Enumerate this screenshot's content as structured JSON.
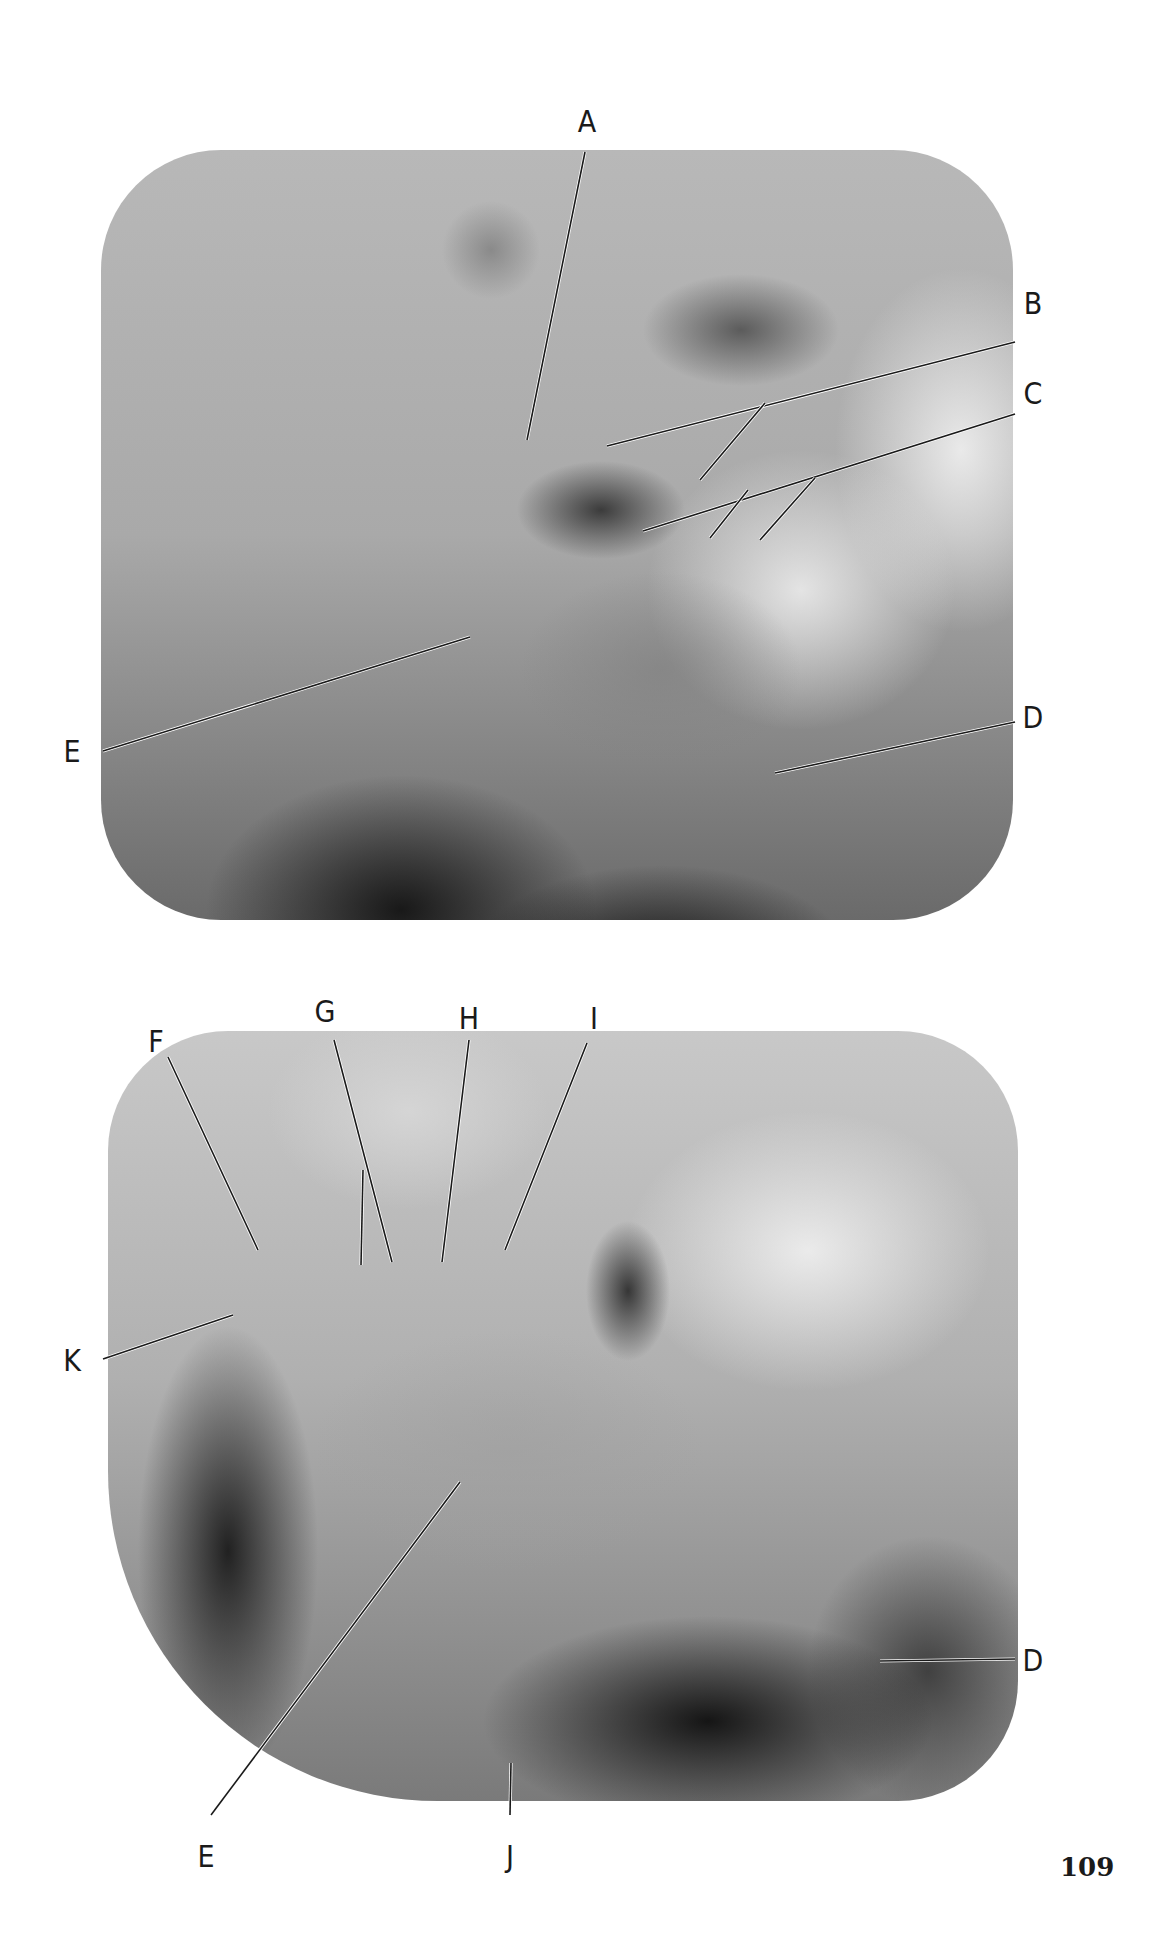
{
  "page": {
    "number": "109",
    "background": "#ffffff"
  },
  "figures": [
    {
      "id": "top",
      "description": "Lateral jaw radiograph (upper figure)",
      "labels": [
        {
          "text": "A",
          "x": 587,
          "y": 122,
          "line": [
            [
              585,
              152
            ],
            [
              527,
              440
            ]
          ]
        },
        {
          "text": "B",
          "x": 1033,
          "y": 304,
          "line": [
            [
              1015,
              342
            ],
            [
              607,
              446
            ]
          ]
        },
        {
          "text": "C",
          "x": 1033,
          "y": 394,
          "line": [
            [
              1015,
              414
            ],
            [
              643,
              531
            ]
          ]
        },
        {
          "text": "D",
          "x": 1033,
          "y": 718,
          "line": [
            [
              1015,
              722
            ],
            [
              775,
              773
            ]
          ]
        },
        {
          "text": "E",
          "x": 72,
          "y": 752,
          "line": [
            [
              103,
              751
            ],
            [
              470,
              637
            ]
          ]
        }
      ],
      "extra_lines": [
        [
          [
            765,
            403
          ],
          [
            700,
            480
          ]
        ],
        [
          [
            748,
            490
          ],
          [
            710,
            538
          ]
        ],
        [
          [
            815,
            478
          ],
          [
            760,
            540
          ]
        ]
      ]
    },
    {
      "id": "bottom",
      "description": "Lateral jaw radiograph (lower figure)",
      "labels": [
        {
          "text": "F",
          "x": 156,
          "y": 1042,
          "line": [
            [
              168,
              1057
            ],
            [
              258,
              1250
            ]
          ]
        },
        {
          "text": "G",
          "x": 325,
          "y": 1012,
          "line": [
            [
              334,
              1040
            ],
            [
              392,
              1262
            ]
          ]
        },
        {
          "text": "H",
          "x": 469,
          "y": 1019,
          "line": [
            [
              469,
              1040
            ],
            [
              442,
              1262
            ]
          ]
        },
        {
          "text": "I",
          "x": 594,
          "y": 1019,
          "line": [
            [
              587,
              1043
            ],
            [
              505,
              1250
            ]
          ]
        },
        {
          "text": "K",
          "x": 72,
          "y": 1361,
          "line": [
            [
              103,
              1359
            ],
            [
              233,
              1315
            ]
          ]
        },
        {
          "text": "D",
          "x": 1033,
          "y": 1661,
          "line": [
            [
              1015,
              1659
            ],
            [
              880,
              1661
            ]
          ]
        },
        {
          "text": "E",
          "x": 206,
          "y": 1857,
          "line": [
            [
              211,
              1815
            ],
            [
              460,
              1482
            ]
          ]
        },
        {
          "text": "J",
          "x": 510,
          "y": 1857,
          "line": [
            [
              510,
              1815
            ],
            [
              511,
              1763
            ]
          ]
        }
      ],
      "extra_lines": [
        [
          [
            363,
            1170
          ],
          [
            361,
            1265
          ]
        ]
      ]
    }
  ]
}
